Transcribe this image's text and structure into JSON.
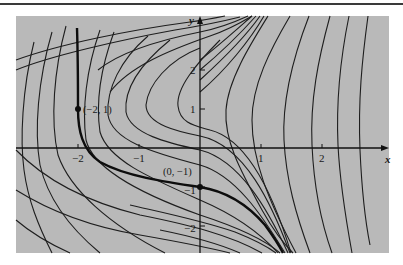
{
  "figure": {
    "kind": "solution curves / direction field of a first-order ODE",
    "background_color": "#b9b9b9",
    "curve_color": "#1e1e1e",
    "highlight_curve_color": "#0d0d0d"
  },
  "axes": {
    "x_label": "x",
    "y_label": "y",
    "x_ticks": [
      {
        "value": -2,
        "label": "−2"
      },
      {
        "value": -1,
        "label": "−1"
      },
      {
        "value": 1,
        "label": "1"
      },
      {
        "value": 2,
        "label": "2"
      }
    ],
    "y_ticks": [
      {
        "value": 2,
        "label": "2"
      },
      {
        "value": 1,
        "label": "1"
      },
      {
        "value": -1,
        "label": "−1"
      },
      {
        "value": -2,
        "label": "−2"
      }
    ],
    "x_range": [
      -3.0,
      3.1
    ],
    "y_range": [
      -2.7,
      3.4
    ]
  },
  "points": [
    {
      "x": -2,
      "y": 1,
      "label": "(−2, 1)"
    },
    {
      "x": 0,
      "y": -1,
      "label": "(0, −1)"
    }
  ],
  "highlighted_solution": {
    "description": "Bold solution curve through (−2,1) and (0,−1)"
  }
}
